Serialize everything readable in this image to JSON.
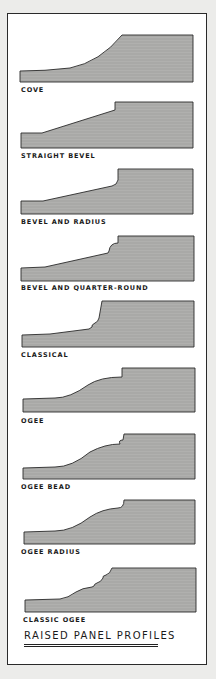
{
  "colors": {
    "background": "#ececea",
    "sheet": "#ffffff",
    "panel_fill": "#a9a9a7",
    "outline": "#2a2a2a"
  },
  "profiles": [
    {
      "label": "COVE"
    },
    {
      "label": "STRAIGHT BEVEL"
    },
    {
      "label": "BEVEL AND RADIUS"
    },
    {
      "label": "BEVEL AND QUARTER-ROUND"
    },
    {
      "label": "CLASSICAL"
    },
    {
      "label": "OGEE"
    },
    {
      "label": "OGEE BEAD"
    },
    {
      "label": "OGEE RADIUS"
    },
    {
      "label": "CLASSIC OGEE"
    }
  ],
  "title": "RAISED PANEL PROFILES"
}
